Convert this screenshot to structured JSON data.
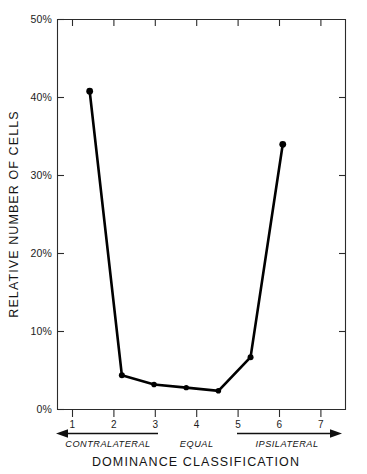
{
  "chart_data": {
    "type": "line",
    "title": "",
    "xlabel": "DOMINANCE CLASSIFICATION",
    "ylabel": "RELATIVE NUMBER OF CELLS",
    "categories": [
      "1",
      "2",
      "3",
      "4",
      "5",
      "6",
      "7"
    ],
    "x": [
      1,
      2,
      3,
      4,
      5,
      6,
      7
    ],
    "values": [
      40.8,
      4.4,
      3.2,
      2.8,
      2.4,
      6.7,
      34.0
    ],
    "series": [
      {
        "name": "Relative number of cells",
        "values": [
          40.8,
          4.4,
          3.2,
          2.8,
          2.4,
          6.7,
          34.0
        ]
      }
    ],
    "ylim": [
      0,
      50
    ],
    "xlim": [
      0.5,
      7.5
    ],
    "ytick_values": [
      0,
      10,
      20,
      30,
      40,
      50
    ],
    "ytick_labels": [
      "0%",
      "10%",
      "20%",
      "30%",
      "40%",
      "50%"
    ],
    "xtick_labels": [
      "1",
      "2",
      "3",
      "4",
      "5",
      "6",
      "7"
    ],
    "grid": false,
    "legend": false,
    "markers": "filled-circle",
    "annotations": [
      {
        "label": "CONTRALATERAL",
        "from": 3,
        "to": 1,
        "arrow": "left"
      },
      {
        "label": "EQUAL",
        "from": 4,
        "to": 4,
        "arrow": "none"
      },
      {
        "label": "IPSILATERAL",
        "from": 5,
        "to": 7,
        "arrow": "right"
      }
    ]
  },
  "axes": {
    "y_label": "RELATIVE NUMBER OF CELLS",
    "x_label": "DOMINANCE CLASSIFICATION",
    "y_ticks": [
      {
        "value": 50,
        "label": "50%"
      },
      {
        "value": 40,
        "label": "40%"
      },
      {
        "value": 30,
        "label": "30%"
      },
      {
        "value": 20,
        "label": "20%"
      },
      {
        "value": 10,
        "label": "10%"
      },
      {
        "value": 0,
        "label": "0%"
      }
    ],
    "x_ticks": [
      {
        "value": 1,
        "label": "1"
      },
      {
        "value": 2,
        "label": "2"
      },
      {
        "value": 3,
        "label": "3"
      },
      {
        "value": 4,
        "label": "4"
      },
      {
        "value": 5,
        "label": "5"
      },
      {
        "value": 6,
        "label": "6"
      },
      {
        "value": 7,
        "label": "7"
      }
    ]
  },
  "regions": {
    "contralateral": "CONTRALATERAL",
    "equal": "EQUAL",
    "ipsilateral": "IPSILATERAL"
  },
  "colors": {
    "line": "#000000",
    "marker": "#000000",
    "axis": "#2b2b2b",
    "text": "#141414",
    "background": "#ffffff"
  }
}
